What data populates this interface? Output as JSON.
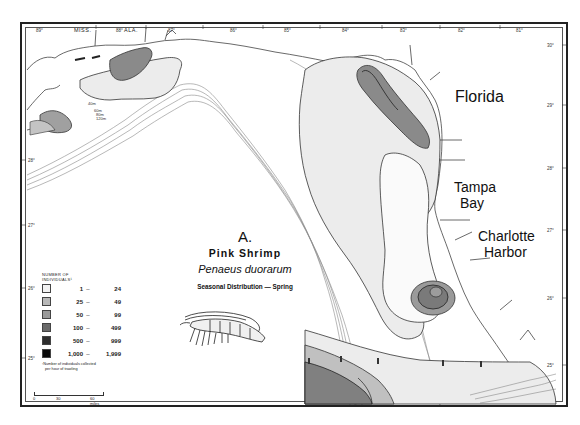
{
  "figure": {
    "panel_letter": "A.",
    "common_name": "Pink Shrimp",
    "scientific_name": "Penaeus duorarum",
    "subtitle": "Seasonal Distribution — Spring"
  },
  "place_labels": {
    "florida": "Florida",
    "tampa_line1": "Tampa",
    "tampa_line2": "Bay",
    "charlotte_line1": "Charlotte",
    "charlotte_line2": "Harbor",
    "miss": "MISS.",
    "ala": "ALA."
  },
  "longitude_ticks": [
    "89°",
    "88°",
    "87°",
    "86°",
    "85°",
    "84°",
    "83°",
    "82°",
    "81°"
  ],
  "latitude_ticks": [
    "30°",
    "29°",
    "28°",
    "27°",
    "26°",
    "25°"
  ],
  "depth_contours": [
    "40m",
    "60m",
    "80m",
    "120m"
  ],
  "legend": {
    "title_line1": "NUMBER OF",
    "title_line2": "INDIVIDUALS¹",
    "items": [
      {
        "min": "1",
        "max": "24",
        "color": "#f2f2f2"
      },
      {
        "min": "25",
        "max": "49",
        "color": "#b8b8b8"
      },
      {
        "min": "50",
        "max": "99",
        "color": "#9a9a9a"
      },
      {
        "min": "100",
        "max": "499",
        "color": "#6a6a6a"
      },
      {
        "min": "500",
        "max": "999",
        "color": "#2e2e2e"
      },
      {
        "min": "1,000",
        "max": "1,999",
        "color": "#0a0a0a"
      }
    ],
    "dash": "–",
    "footnote_line1": "¹Number of individuals collected",
    "footnote_line2": "per hour of trawling"
  },
  "scale_bar": {
    "labels": [
      "0",
      "30",
      "60 miles"
    ]
  },
  "colors": {
    "zone_light": "#ececec",
    "zone_mid": "#a9a9a9",
    "zone_dark": "#7a7a7a",
    "zone_core": "#8c8c8c",
    "line": "#333333",
    "contour": "#777777"
  }
}
